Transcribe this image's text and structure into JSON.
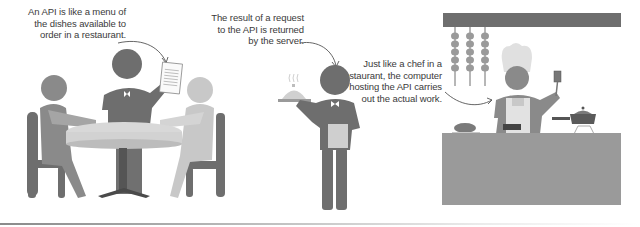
{
  "panels": [
    {
      "id": "menu",
      "caption": "An API is like a menu of\nthe dishes available to\norder in a restaurant.",
      "scene": "diners-at-table-with-waiter-holding-menu"
    },
    {
      "id": "result",
      "caption": "The result of a request\nto the API is returned\nby the server.",
      "scene": "waiter-carrying-covered-dish"
    },
    {
      "id": "chef",
      "caption": "Just like a chef in a\nrestaurant, the computer\nhosting the API carries\nout the actual work.",
      "scene": "chef-cooking-in-kitchen"
    }
  ],
  "colors": {
    "dark_figure": "#6e6e6e",
    "mid_figure": "#8c8c8c",
    "light_figure": "#c4c4c4",
    "table_top": "#d6d6d6",
    "counter": "#9a9a9a",
    "rack": "#707070",
    "text": "#3a3a3a"
  }
}
